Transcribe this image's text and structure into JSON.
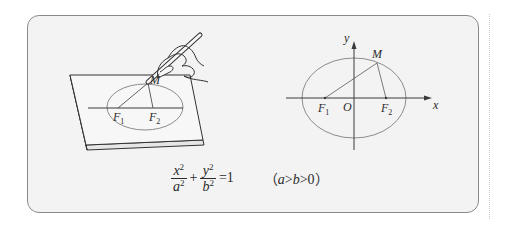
{
  "figure": {
    "left_illustration": {
      "description": "hand drawing an ellipse with a string fixed at two foci on a board",
      "labels": {
        "point_m": "M",
        "focus_1": "F",
        "focus_1_sub": "1",
        "focus_2": "F",
        "focus_2_sub": "2"
      }
    },
    "right_diagram": {
      "description": "ellipse on coordinate axes with foci and point M",
      "labels": {
        "axis_x": "x",
        "axis_y": "y",
        "origin": "O",
        "point_m": "M",
        "focus_1": "F",
        "focus_1_sub": "1",
        "focus_2": "F",
        "focus_2_sub": "2"
      }
    },
    "formula": {
      "term1_num": "x",
      "term1_num_exp": "2",
      "term1_den": "a",
      "term1_den_exp": "2",
      "plus": "+",
      "term2_num": "y",
      "term2_num_exp": "2",
      "term2_den": "b",
      "term2_den_exp": "2",
      "equals": "=1",
      "cond_open": "（",
      "cond_a": "a",
      "cond_gt1": ">",
      "cond_b": "b",
      "cond_gt2": ">0",
      "cond_close": "）"
    },
    "colors": {
      "card_background": "#f3f3f3",
      "card_border": "#8a8a8a",
      "ellipse_stroke": "#8c8c8c",
      "line_stroke": "#3a3a3a"
    }
  }
}
